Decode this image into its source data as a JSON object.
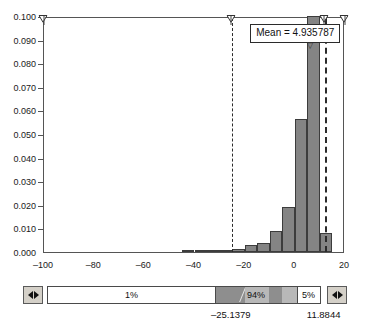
{
  "chart_data": {
    "type": "bar",
    "title": "",
    "subtitle": "",
    "xlabel": "",
    "ylabel": "",
    "xlim": [
      -100,
      20
    ],
    "ylim": [
      0.0,
      0.1
    ],
    "grid": false,
    "legend": "none",
    "bin_width": 5,
    "x_ticks": [
      -100,
      -80,
      -60,
      -40,
      -20,
      0,
      20
    ],
    "x_tick_labels": [
      "–100",
      "–80",
      "–60",
      "–40",
      "–20",
      "0",
      "20"
    ],
    "y_ticks": [
      0.0,
      0.01,
      0.02,
      0.03,
      0.04,
      0.05,
      0.06,
      0.07,
      0.08,
      0.09,
      0.1
    ],
    "y_tick_labels": [
      "0.000",
      "0.010",
      "0.020",
      "0.030",
      "0.040",
      "0.050",
      "0.060",
      "0.070",
      "0.080",
      "0.090",
      "0.100"
    ],
    "bars": [
      {
        "x_left": -45,
        "x_right": -40,
        "value": 0.0004
      },
      {
        "x_left": -40,
        "x_right": -35,
        "value": 0.0004
      },
      {
        "x_left": -35,
        "x_right": -30,
        "value": 0.0005
      },
      {
        "x_left": -30,
        "x_right": -25,
        "value": 0.0007
      },
      {
        "x_left": -25,
        "x_right": -20,
        "value": 0.0012
      },
      {
        "x_left": -20,
        "x_right": -15,
        "value": 0.0028
      },
      {
        "x_left": -15,
        "x_right": -10,
        "value": 0.004
      },
      {
        "x_left": -10,
        "x_right": -5,
        "value": 0.009
      },
      {
        "x_left": -5,
        "x_right": 0,
        "value": 0.019
      },
      {
        "x_left": 0,
        "x_right": 5,
        "value": 0.0565
      },
      {
        "x_left": 5,
        "x_right": 10,
        "value": 0.1
      },
      {
        "x_left": 10,
        "x_right": 15,
        "value": 0.008
      }
    ],
    "annotations": {
      "mean_label": "Mean = 4.935787",
      "mean_value": 4.935787,
      "lower_limit": -25.1379,
      "upper_limit": 11.8844,
      "lower_limit_label": "–25.1379",
      "upper_limit_label": "11.8844"
    },
    "handles": [
      {
        "name": "handle-left-bound",
        "x": -100
      },
      {
        "name": "handle-lower-limit",
        "x": -25.1379
      },
      {
        "name": "handle-upper-limit",
        "x": 11.8844
      },
      {
        "name": "handle-right-bound",
        "x": 20
      }
    ],
    "colors": {
      "bar_fill": "#848484",
      "bar_stroke": "#3c3c3c",
      "axis": "#555555",
      "limit_line": "#2b2b2b",
      "slider_dark": "#8e8e8e",
      "slider_mid": "#b8b8b8",
      "slider_light": "#ffffff",
      "button_face": "#d4d0c8"
    }
  },
  "slider": {
    "left_spinner": {
      "name": "decrement",
      "left_glyph": "◀",
      "right_glyph": "▶"
    },
    "right_spinner": {
      "name": "increment",
      "left_glyph": "◀",
      "right_glyph": "▶"
    },
    "segments": [
      {
        "label": "1%",
        "value": 1,
        "shade": "light"
      },
      {
        "label": "94%",
        "value": 94,
        "shade": "dark"
      },
      {
        "label": "5%",
        "value": 5,
        "shade": "light"
      }
    ]
  },
  "bottom_values": [
    {
      "label": "–25.1379",
      "value": -25.1379
    },
    {
      "label": "11.8844",
      "value": 11.8844
    }
  ]
}
